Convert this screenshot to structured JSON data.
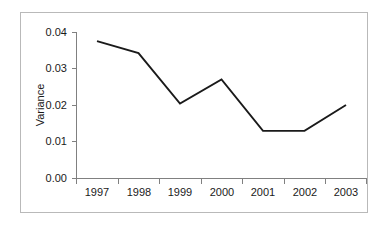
{
  "chart_data": {
    "type": "line",
    "title": "",
    "subtitle": "",
    "xlabel": "",
    "ylabel": "Variance",
    "categories": [
      "1997",
      "1998",
      "1999",
      "2000",
      "2001",
      "2002",
      "2003"
    ],
    "x": [
      1997,
      1998,
      1999,
      2000,
      2001,
      2002,
      2003
    ],
    "values": [
      0.0375,
      0.0342,
      0.0204,
      0.027,
      0.0129,
      0.0129,
      0.02
    ],
    "series": [
      {
        "name": "Variance",
        "values": [
          0.0375,
          0.0342,
          0.0204,
          0.027,
          0.0129,
          0.0129,
          0.02
        ],
        "color": "#1a1a1a"
      }
    ],
    "ylim": [
      0.0,
      0.04
    ],
    "yticks": [
      0.0,
      0.01,
      0.02,
      0.03,
      0.04
    ],
    "ytick_labels": [
      "0.00",
      "0.01",
      "0.02",
      "0.03",
      "0.04"
    ],
    "xtick_labels": [
      "1997",
      "1998",
      "1999",
      "2000",
      "2001",
      "2002",
      "2003"
    ],
    "grid": false,
    "legend": false,
    "legend_position": "none",
    "annotations": []
  },
  "axes": {
    "y_label": "Variance",
    "y_ticks": [
      {
        "label": "0.04",
        "value": 0.04
      },
      {
        "label": "0.03",
        "value": 0.03
      },
      {
        "label": "0.02",
        "value": 0.02
      },
      {
        "label": "0.01",
        "value": 0.01
      },
      {
        "label": "0.00",
        "value": 0.0
      }
    ],
    "x_ticks": [
      {
        "label": "1997"
      },
      {
        "label": "1998"
      },
      {
        "label": "1999"
      },
      {
        "label": "2000"
      },
      {
        "label": "2001"
      },
      {
        "label": "2002"
      },
      {
        "label": "2003"
      }
    ]
  },
  "colors": {
    "line": "#1a1a1a",
    "axis": "#808080",
    "frame": "#b9b9b9",
    "background": "#ffffff",
    "text": "#1a1a1a"
  }
}
